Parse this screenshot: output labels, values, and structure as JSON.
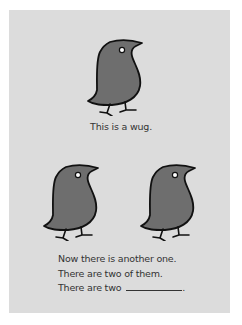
{
  "page": {
    "background": "#ffffff",
    "panel_color": "#dcdcdc",
    "wug_fill": "#6e6e6e",
    "outline": "#111111",
    "text_color": "#333333"
  },
  "top": {
    "caption": "This is a wug.",
    "wug_count": 1
  },
  "bottom": {
    "wug_count": 2,
    "lines": [
      "Now there is another one.",
      "There are two of them.",
      "There are two"
    ],
    "blank_suffix": "."
  }
}
